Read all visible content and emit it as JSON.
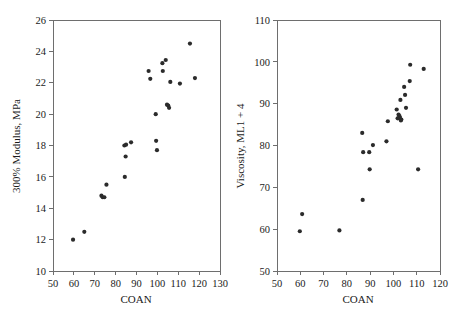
{
  "figure": {
    "background": "#ffffff",
    "point_color": "#2b2b2b",
    "axis_color": "#6e6e6e",
    "panel_count": 2
  },
  "chart_data": [
    {
      "type": "scatter",
      "panel": "left",
      "title": "",
      "xlabel": "COAN",
      "ylabel": "300% Modulus, MPa",
      "xlim": [
        50,
        130
      ],
      "ylim": [
        10,
        26
      ],
      "xticks": [
        50,
        60,
        70,
        80,
        90,
        100,
        110,
        120,
        130
      ],
      "yticks": [
        10,
        12,
        14,
        16,
        18,
        20,
        22,
        24,
        26
      ],
      "xtick_labels": [
        "50",
        "60",
        "70",
        "80",
        "90",
        "100",
        "110",
        "120",
        "130"
      ],
      "ytick_labels": [
        "10",
        "12",
        "14",
        "16",
        "18",
        "20",
        "22",
        "24",
        "26"
      ],
      "grid": false,
      "legend": null,
      "series": [
        {
          "name": "300% Modulus vs COAN",
          "marker": "filled-circle",
          "color": "#2b2b2b",
          "points": [
            [
              59.6,
              12.0
            ],
            [
              65.0,
              12.5
            ],
            [
              73.2,
              14.8
            ],
            [
              73.8,
              14.7
            ],
            [
              74.6,
              14.7
            ],
            [
              75.6,
              15.5
            ],
            [
              84.4,
              16.0
            ],
            [
              84.2,
              18.0
            ],
            [
              85.0,
              18.05
            ],
            [
              84.8,
              17.3
            ],
            [
              87.4,
              18.2
            ],
            [
              95.8,
              22.75
            ],
            [
              96.6,
              22.25
            ],
            [
              99.2,
              20.0
            ],
            [
              99.4,
              18.3
            ],
            [
              99.8,
              17.7
            ],
            [
              102.4,
              23.25
            ],
            [
              102.6,
              22.75
            ],
            [
              104.0,
              23.45
            ],
            [
              104.6,
              20.6
            ],
            [
              105.2,
              20.55
            ],
            [
              105.6,
              20.4
            ],
            [
              106.2,
              22.05
            ],
            [
              110.8,
              21.95
            ],
            [
              115.6,
              24.5
            ],
            [
              118.0,
              22.3
            ]
          ]
        }
      ]
    },
    {
      "type": "scatter",
      "panel": "right",
      "title": "",
      "xlabel": "COAN",
      "ylabel": "Viscosity, ML1 + 4",
      "xlim": [
        50,
        120
      ],
      "ylim": [
        50,
        110
      ],
      "xticks": [
        50,
        60,
        70,
        80,
        90,
        100,
        110,
        120
      ],
      "yticks": [
        50,
        60,
        70,
        80,
        90,
        100,
        110
      ],
      "xtick_labels": [
        "50",
        "60",
        "70",
        "80",
        "90",
        "100",
        "110",
        "120"
      ],
      "ytick_labels": [
        "50",
        "60",
        "70",
        "80",
        "90",
        "100",
        "110"
      ],
      "grid": false,
      "legend": null,
      "series": [
        {
          "name": "Viscosity vs COAN",
          "marker": "filled-circle",
          "color": "#2b2b2b",
          "points": [
            [
              59.8,
              59.5
            ],
            [
              60.8,
              63.6
            ],
            [
              76.8,
              59.7
            ],
            [
              86.8,
              67.0
            ],
            [
              86.6,
              83.0
            ],
            [
              87.0,
              78.4
            ],
            [
              89.6,
              78.4
            ],
            [
              89.8,
              74.3
            ],
            [
              91.2,
              80.1
            ],
            [
              97.0,
              81.0
            ],
            [
              97.6,
              85.8
            ],
            [
              101.4,
              88.6
            ],
            [
              101.8,
              86.5
            ],
            [
              102.2,
              87.4
            ],
            [
              102.6,
              87.0
            ],
            [
              102.8,
              86.6
            ],
            [
              103.2,
              86.0
            ],
            [
              103.0,
              90.9
            ],
            [
              103.4,
              86.2
            ],
            [
              104.6,
              94.0
            ],
            [
              105.0,
              92.1
            ],
            [
              105.4,
              89.0
            ],
            [
              107.2,
              99.3
            ],
            [
              107.0,
              95.4
            ],
            [
              110.6,
              74.3
            ],
            [
              113.0,
              98.3
            ]
          ]
        }
      ]
    }
  ]
}
